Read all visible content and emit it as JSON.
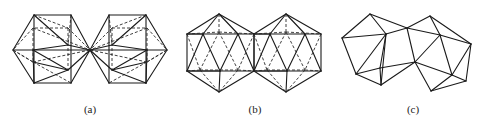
{
  "figure": {
    "panels": [
      {
        "id": "a",
        "caption": "(a)",
        "description": "two icosahedra joined at a single vertex, hidden edges dashed"
      },
      {
        "id": "b",
        "caption": "(b)",
        "description": "two icosahedra sharing an edge, hidden edges dashed"
      },
      {
        "id": "c",
        "caption": "(c)",
        "description": "two icosahedra merged face-to-face, visible edges only"
      }
    ]
  }
}
